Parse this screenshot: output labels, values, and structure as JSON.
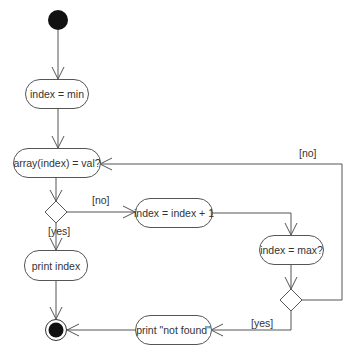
{
  "diagram": {
    "type": "UML activity diagram",
    "nodes": {
      "init": "index = min",
      "check": "array(index) = val?",
      "increment": "index = index + 1",
      "check_max": "index = max?",
      "print_index": "print index",
      "print_not_found": "print \"not found\""
    },
    "guards": {
      "first_no": "[no]",
      "first_yes": "[yes]",
      "loop_no": "[no]",
      "second_yes": "[yes]"
    },
    "colors": {
      "line": "#555555",
      "fill": "#ffffff",
      "start": "#111111"
    }
  }
}
